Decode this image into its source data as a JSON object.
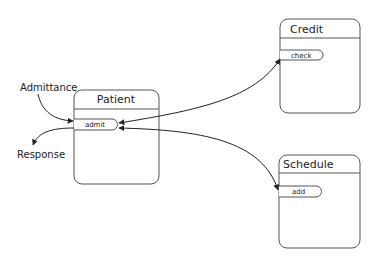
{
  "diagram": {
    "objects": [
      {
        "name": "Patient",
        "method": "admit"
      },
      {
        "name": "Credit",
        "method": "check"
      },
      {
        "name": "Schedule",
        "method": "add"
      }
    ],
    "labels": {
      "input": "Admittance",
      "output": "Response"
    },
    "colors": {
      "stroke": "#333333",
      "box_stroke": "#555555",
      "background": "#ffffff"
    }
  }
}
